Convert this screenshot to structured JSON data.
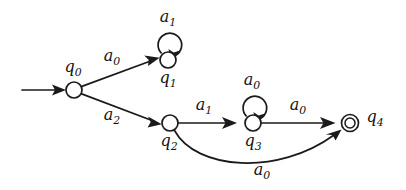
{
  "diagram": {
    "kind": "finite-state-automaton",
    "background_color": "#ffffff",
    "stroke_color": "#1a1a1a",
    "width": 406,
    "height": 190,
    "states": [
      {
        "id": "q0",
        "base": "q",
        "sub": "0",
        "label": "q0",
        "cx": 74,
        "cy": 90,
        "r": 8,
        "accepting": false,
        "initial": true,
        "label_x": 73,
        "label_y": 69
      },
      {
        "id": "q1",
        "base": "q",
        "sub": "1",
        "label": "q1",
        "cx": 168,
        "cy": 60,
        "r": 8,
        "accepting": false,
        "initial": false,
        "label_x": 168,
        "label_y": 80
      },
      {
        "id": "q2",
        "base": "q",
        "sub": "2",
        "label": "q2",
        "cx": 170,
        "cy": 123,
        "r": 8,
        "accepting": false,
        "initial": false,
        "label_x": 169,
        "label_y": 143
      },
      {
        "id": "q3",
        "base": "q",
        "sub": "3",
        "label": "q3",
        "cx": 253,
        "cy": 123,
        "r": 8,
        "accepting": false,
        "initial": false,
        "label_x": 253,
        "label_y": 143
      },
      {
        "id": "q4",
        "base": "q",
        "sub": "4",
        "label": "q4",
        "cx": 350,
        "cy": 123,
        "r": 8,
        "accepting": true,
        "initial": false,
        "label_x": 375,
        "label_y": 119
      }
    ],
    "transitions": [
      {
        "from": "start",
        "to": "q0",
        "symbol": "",
        "base": "",
        "sub": "",
        "shape": "straight"
      },
      {
        "from": "q0",
        "to": "q1",
        "symbol": "a0",
        "base": "a",
        "sub": "0",
        "shape": "straight",
        "label_x": 112,
        "label_y": 58
      },
      {
        "from": "q1",
        "to": "q1",
        "symbol": "a1",
        "base": "a",
        "sub": "1",
        "shape": "self-loop",
        "label_x": 168,
        "label_y": 19
      },
      {
        "from": "q0",
        "to": "q2",
        "symbol": "a2",
        "base": "a",
        "sub": "2",
        "shape": "straight",
        "label_x": 112,
        "label_y": 117
      },
      {
        "from": "q2",
        "to": "q3",
        "symbol": "a1",
        "base": "a",
        "sub": "1",
        "shape": "straight",
        "label_x": 204,
        "label_y": 107
      },
      {
        "from": "q3",
        "to": "q3",
        "symbol": "a0",
        "base": "a",
        "sub": "0",
        "shape": "self-loop",
        "label_x": 252,
        "label_y": 82
      },
      {
        "from": "q3",
        "to": "q4",
        "symbol": "a0",
        "base": "a",
        "sub": "0",
        "shape": "straight",
        "label_x": 298,
        "label_y": 107
      },
      {
        "from": "q2",
        "to": "q4",
        "symbol": "a0",
        "base": "a",
        "sub": "0",
        "shape": "curve-below",
        "label_x": 262,
        "label_y": 172
      }
    ],
    "start_arrow": {
      "x1": 22,
      "y1": 90,
      "x2": 66,
      "y2": 90
    }
  }
}
